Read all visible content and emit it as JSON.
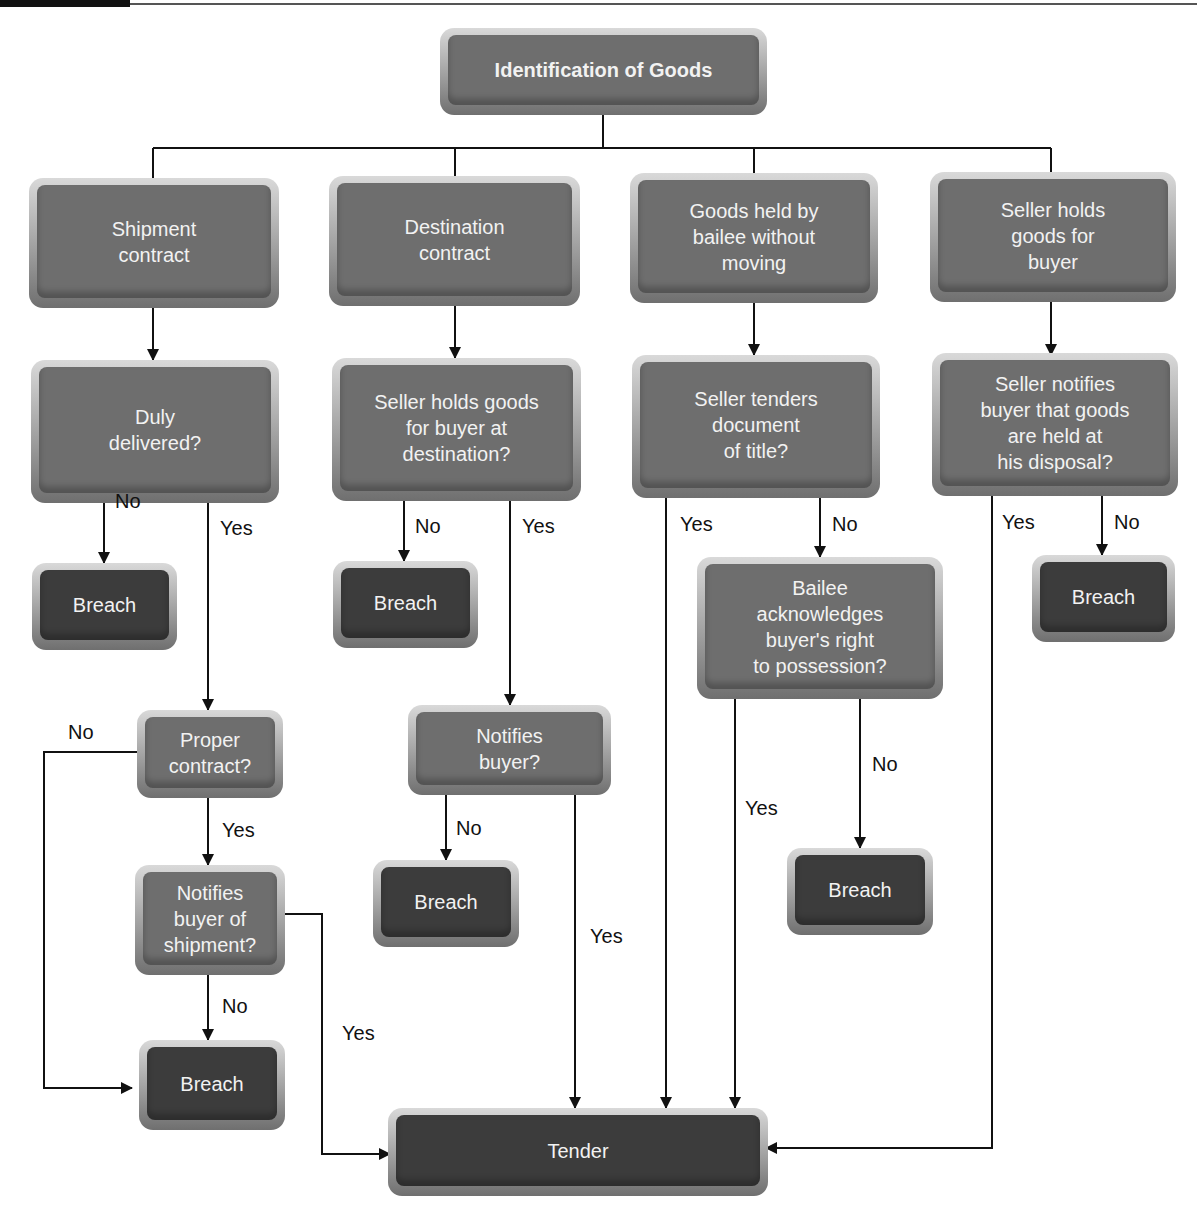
{
  "diagram": {
    "title": "Identification of Goods",
    "nodes": {
      "root": "Identification of Goods",
      "shipment": "Shipment\ncontract",
      "destination": "Destination\ncontract",
      "bailee": "Goods held by\nbailee without\nmoving",
      "seller_holds": "Seller holds\ngoods for\nbuyer",
      "duly_delivered": "Duly\ndelivered?",
      "seller_holds_dest": "Seller holds goods\nfor buyer at\ndestination?",
      "tenders_doc": "Seller tenders\ndocument\nof title?",
      "notifies_disposal": "Seller notifies\nbuyer that goods\nare held at\nhis disposal?",
      "breach_1": "Breach",
      "breach_2": "Breach",
      "breach_3": "Breach",
      "breach_4": "Breach",
      "breach_5": "Breach",
      "breach_6": "Breach",
      "bailee_ack": "Bailee\nacknowledges\nbuyer's right\nto possession?",
      "proper_contract": "Proper\ncontract?",
      "notifies_buyer": "Notifies\nbuyer?",
      "notifies_shipment": "Notifies\nbuyer of\nshipment?",
      "tender": "Tender"
    },
    "labels": {
      "no": "No",
      "yes": "Yes"
    }
  }
}
